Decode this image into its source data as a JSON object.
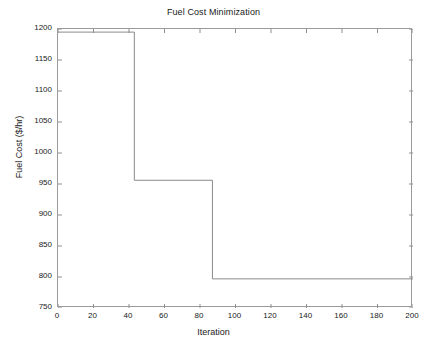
{
  "chart_data": {
    "type": "line",
    "title": "Fuel Cost Minimization",
    "xlabel": "Iteration",
    "ylabel": "Fuel Cost ($/hr)",
    "xlim": [
      0,
      200
    ],
    "ylim": [
      750,
      1200
    ],
    "xticks": [
      0,
      20,
      40,
      60,
      80,
      100,
      120,
      140,
      160,
      180,
      200
    ],
    "yticks": [
      750,
      800,
      850,
      900,
      950,
      1000,
      1050,
      1100,
      1150,
      1200
    ],
    "xtick_labels": [
      "0",
      "20",
      "40",
      "60",
      "80",
      "100",
      "120",
      "140",
      "160",
      "180",
      "200"
    ],
    "ytick_labels": [
      "750",
      "800",
      "850",
      "900",
      "950",
      "1000",
      "1050",
      "1100",
      "1150",
      "1200"
    ],
    "grid": false,
    "box": true,
    "legend": null,
    "line_color": "#8a8a8a",
    "series": [
      {
        "name": "Best fuel cost",
        "step_type": "post",
        "x": [
          0,
          43,
          43,
          87,
          87,
          200
        ],
        "y": [
          1195,
          1195,
          956,
          956,
          797,
          797
        ],
        "plateaus": [
          {
            "from_iteration": 0,
            "to_iteration": 43,
            "value": 1195
          },
          {
            "from_iteration": 43,
            "to_iteration": 87,
            "value": 956
          },
          {
            "from_iteration": 87,
            "to_iteration": 200,
            "value": 797
          }
        ]
      }
    ],
    "annotations": []
  },
  "figure": {
    "title": "Fuel Cost Minimization",
    "xlabel": "Iteration",
    "ylabel": "Fuel Cost ($/hr)"
  }
}
